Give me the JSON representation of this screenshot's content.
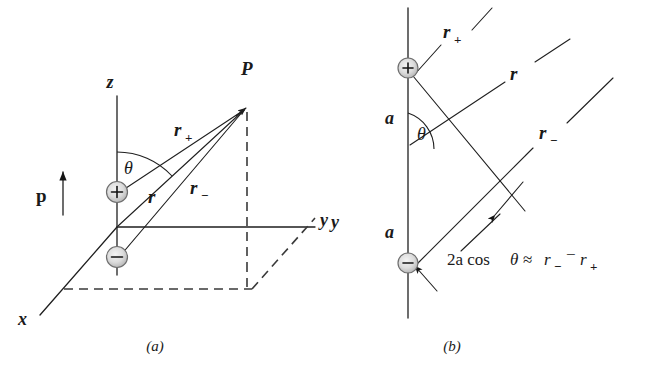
{
  "figure": {
    "title_caption_a": "(a)",
    "title_caption_b": "(b)",
    "panels": [
      {
        "id": "panel-a",
        "caption": "(a)",
        "description": "Electric dipole in 3D axes with point P",
        "labels": {
          "axis_z": "z",
          "axis_y": "y",
          "axis_x": "x",
          "point_p": "P",
          "dipole_moment": "p",
          "angle": "θ",
          "r_plus_base": "r",
          "r_plus_sub": "+",
          "r_center": "r",
          "r_minus_base": "r",
          "r_minus_sub": "−",
          "charge_positive": "+",
          "charge_negative": "−"
        }
      },
      {
        "id": "panel-b",
        "caption": "(b)",
        "description": "Far-field approximation geometry with parallel rays",
        "labels": {
          "axis_y": "y",
          "distance_upper": "a",
          "distance_lower": "a",
          "angle": "θ",
          "r_plus_base": "r",
          "r_plus_sub": "+",
          "r_center": "r",
          "r_minus_base": "r",
          "r_minus_sub": "−",
          "charge_positive": "+",
          "charge_negative": "−",
          "equation_lead": "2a cos ",
          "equation_theta": "θ",
          "equation_approx": " ≈ ",
          "equation_r_minus": "r",
          "equation_r_minus_sub": "−",
          "equation_minus": "−",
          "equation_r_plus": "r",
          "equation_r_plus_sub": "+"
        }
      }
    ]
  },
  "colors": {
    "ink": "#1a1a1a",
    "line": "#1f1f1f",
    "dashed": "#3a3a3a",
    "charge_fill_center": "#f2f2f2",
    "charge_fill_edge": "#b9b9b9",
    "background": "#ffffff"
  }
}
